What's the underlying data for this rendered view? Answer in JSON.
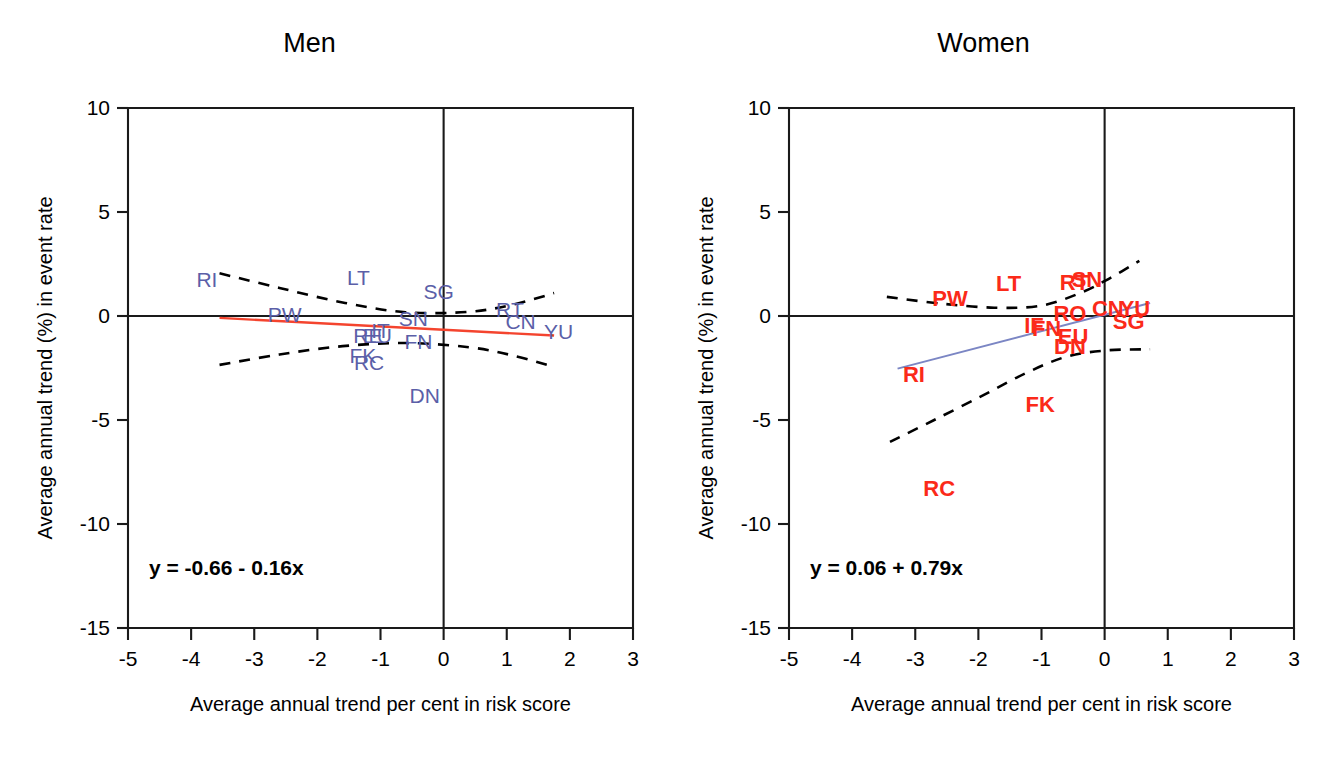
{
  "figure": {
    "background": "#ffffff",
    "men_color": "#5b5fa8",
    "men_fit_color": "#f4442e",
    "women_color": "#fb2a19",
    "women_fit_color": "#7b86c4",
    "ci_color": "#000000"
  },
  "axes": {
    "xlabel": "Average annual trend per cent in risk score",
    "ylabel": "Average annual trend (%) in event rate",
    "xticks": [
      "-5",
      "-4",
      "-3",
      "-2",
      "-1",
      "0",
      "1",
      "2",
      "3"
    ],
    "yticks": [
      "10",
      "5",
      "0",
      "-5",
      "-10",
      "-15"
    ],
    "xlim": [
      -5,
      3
    ],
    "ylim": [
      -15,
      10
    ]
  },
  "panels": [
    {
      "key": "men",
      "title": "Men",
      "equation": "y = -0.66 - 0.16x"
    },
    {
      "key": "women",
      "title": "Women",
      "equation": "y = 0.06 + 0.79x"
    }
  ],
  "chart_data": [
    {
      "type": "scatter",
      "title": "Men",
      "xlabel": "Average annual trend per cent in risk score",
      "ylabel": "Average annual trend (%) in event rate",
      "xlim": [
        -5,
        3
      ],
      "ylim": [
        -15,
        10
      ],
      "grid": false,
      "legend": "none",
      "point_color": "#5b5fa8",
      "fit_color": "#f4442e",
      "annotation": "y = -0.66 - 0.16x",
      "fit": {
        "intercept": -0.66,
        "slope": -0.16,
        "x_start": -3.55,
        "x_end": 1.75
      },
      "points": [
        {
          "label": "RI",
          "x": -3.75,
          "y": 1.75
        },
        {
          "label": "LT",
          "x": -1.35,
          "y": 1.85
        },
        {
          "label": "SG",
          "x": -0.08,
          "y": 1.15
        },
        {
          "label": "PW",
          "x": -2.52,
          "y": 0.05
        },
        {
          "label": "SN",
          "x": -0.48,
          "y": -0.15
        },
        {
          "label": "RT",
          "x": 1.05,
          "y": 0.3
        },
        {
          "label": "CN",
          "x": 1.22,
          "y": -0.28
        },
        {
          "label": "YU",
          "x": 1.82,
          "y": -0.78
        },
        {
          "label": "RE",
          "x": -1.2,
          "y": -0.98
        },
        {
          "label": "EU",
          "x": -1.05,
          "y": -0.98
        },
        {
          "label": "IT",
          "x": -1.0,
          "y": -0.72
        },
        {
          "label": "FN",
          "x": -0.4,
          "y": -1.25
        },
        {
          "label": "FK",
          "x": -1.28,
          "y": -1.9
        },
        {
          "label": "RC",
          "x": -1.18,
          "y": -2.25
        },
        {
          "label": "DN",
          "x": -0.3,
          "y": -3.85
        }
      ],
      "ci_upper": [
        {
          "x": -3.55,
          "y": 2.05
        },
        {
          "x": -2.6,
          "y": 1.35
        },
        {
          "x": -1.6,
          "y": 0.65
        },
        {
          "x": -0.6,
          "y": 0.18
        },
        {
          "x": 0.4,
          "y": 0.2
        },
        {
          "x": 1.1,
          "y": 0.55
        },
        {
          "x": 1.75,
          "y": 1.1
        }
      ],
      "ci_lower": [
        {
          "x": -3.55,
          "y": -2.35
        },
        {
          "x": -2.6,
          "y": -1.85
        },
        {
          "x": -1.6,
          "y": -1.45
        },
        {
          "x": -0.6,
          "y": -1.3
        },
        {
          "x": 0.4,
          "y": -1.5
        },
        {
          "x": 1.1,
          "y": -1.9
        },
        {
          "x": 1.75,
          "y": -2.45
        }
      ]
    },
    {
      "type": "scatter",
      "title": "Women",
      "xlabel": "Average annual trend per cent in risk score",
      "ylabel": "Average annual trend (%) in event rate",
      "xlim": [
        -5,
        3
      ],
      "ylim": [
        -15,
        10
      ],
      "grid": false,
      "legend": "none",
      "point_color": "#fb2a19",
      "fit_color": "#7b86c4",
      "annotation": "y = 0.06 + 0.79x",
      "fit": {
        "intercept": 0.06,
        "slope": 0.79,
        "x_start": -3.28,
        "x_end": 0.72
      },
      "points": [
        {
          "label": "LT",
          "x": -1.52,
          "y": 1.55
        },
        {
          "label": "RT",
          "x": -0.48,
          "y": 1.6
        },
        {
          "label": "SN",
          "x": -0.28,
          "y": 1.75
        },
        {
          "label": "PW",
          "x": -2.45,
          "y": 0.8
        },
        {
          "label": "RO",
          "x": -0.55,
          "y": 0.12
        },
        {
          "label": "CN",
          "x": 0.05,
          "y": 0.35
        },
        {
          "label": "YU",
          "x": 0.48,
          "y": 0.35
        },
        {
          "label": "SG",
          "x": 0.38,
          "y": -0.28
        },
        {
          "label": "IF",
          "x": -1.12,
          "y": -0.5
        },
        {
          "label": "FN",
          "x": -0.92,
          "y": -0.62
        },
        {
          "label": "EU",
          "x": -0.5,
          "y": -1.0
        },
        {
          "label": "DN",
          "x": -0.55,
          "y": -1.5
        },
        {
          "label": "RI",
          "x": -3.02,
          "y": -2.85
        },
        {
          "label": "FK",
          "x": -1.02,
          "y": -4.3
        },
        {
          "label": "RC",
          "x": -2.62,
          "y": -8.3
        }
      ],
      "ci_upper": [
        {
          "x": -3.45,
          "y": 0.92
        },
        {
          "x": -2.6,
          "y": 0.6
        },
        {
          "x": -1.75,
          "y": 0.4
        },
        {
          "x": -1.0,
          "y": 0.5
        },
        {
          "x": -0.35,
          "y": 1.15
        },
        {
          "x": 0.1,
          "y": 1.85
        },
        {
          "x": 0.55,
          "y": 2.65
        }
      ],
      "ci_lower": [
        {
          "x": -3.4,
          "y": -6.05
        },
        {
          "x": -2.7,
          "y": -5.0
        },
        {
          "x": -1.95,
          "y": -3.85
        },
        {
          "x": -1.25,
          "y": -2.75
        },
        {
          "x": -0.6,
          "y": -1.95
        },
        {
          "x": 0.05,
          "y": -1.65
        },
        {
          "x": 0.72,
          "y": -1.6
        }
      ]
    }
  ]
}
